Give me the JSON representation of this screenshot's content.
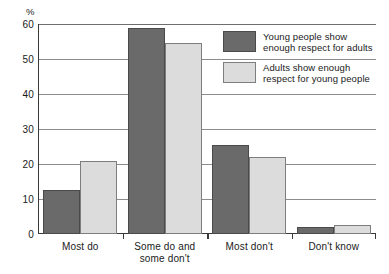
{
  "chart_data": {
    "type": "bar",
    "title": "",
    "xlabel": "",
    "ylabel": "%",
    "ylim": [
      0,
      60
    ],
    "yticks": [
      0,
      10,
      20,
      30,
      40,
      50,
      60
    ],
    "ytick_labels": [
      "0",
      "10",
      "20",
      "30",
      "40",
      "50",
      "60"
    ],
    "grid": true,
    "legend_position": "upper right",
    "categories": [
      "Most do",
      "Some do and\nsome don't",
      "Most don't",
      "Don't know"
    ],
    "category_lines": [
      [
        "Most do"
      ],
      [
        "Some do and",
        "some don't"
      ],
      [
        "Most don't"
      ],
      [
        "Don't know"
      ]
    ],
    "series": [
      {
        "name": "Young people show enough respect for adults",
        "name_lines": [
          "Young people show",
          "enough respect for adults"
        ],
        "color": "#6a6a6a",
        "values": [
          12.5,
          59,
          25.5,
          2
        ]
      },
      {
        "name": "Adults show enough respect for young people",
        "name_lines": [
          "Adults show enough",
          "respect for young people"
        ],
        "color": "#dcdcdc",
        "values": [
          21,
          54.5,
          22,
          2.5
        ]
      }
    ]
  },
  "axis": {
    "unit_label": "%"
  },
  "colors": {
    "series_a": "#6a6a6a",
    "series_b": "#dcdcdc",
    "axis": "#3a3a3a",
    "grid": "#8c8c8c",
    "background": "#ffffff"
  }
}
